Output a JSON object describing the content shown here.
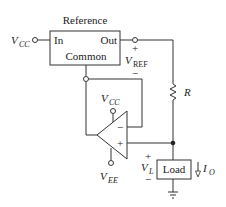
{
  "diagram": {
    "type": "circuit-schematic",
    "reference_block": {
      "title": "Reference",
      "pins": {
        "in": "In",
        "out": "Out",
        "common": "Common"
      }
    },
    "supply_input": {
      "symbol": "V",
      "subscript": "CC"
    },
    "vref": {
      "plus": "+",
      "symbol": "V",
      "subscript": "REF",
      "minus": "−"
    },
    "resistor": {
      "label": "R"
    },
    "opamp": {
      "supply_pos": {
        "symbol": "V",
        "subscript": "CC"
      },
      "supply_neg": {
        "symbol": "V",
        "subscript": "EE"
      },
      "inv_input": "−",
      "noninv_input": "+"
    },
    "load": {
      "label": "Load",
      "voltage": {
        "plus": "+",
        "symbol": "V",
        "subscript": "L",
        "minus": "−"
      },
      "current": {
        "symbol": "I",
        "subscript": "O"
      }
    }
  }
}
